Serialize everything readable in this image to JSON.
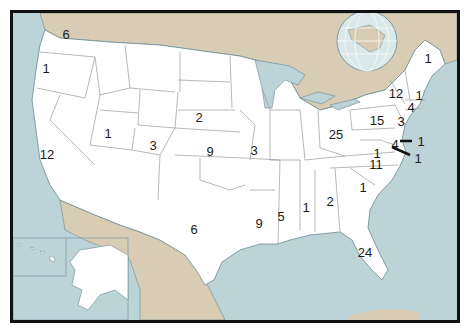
{
  "map": {
    "type": "US states choropleth-style count map",
    "colors": {
      "ocean": "#bcd3d8",
      "land_foreign": "#d9ccb4",
      "land_us": "#ffffff",
      "state_border": "#9a9a9a",
      "frame": "#111111",
      "label": "#1a1a1a"
    },
    "inset_globe": true,
    "inset_alaska_hawaii": true,
    "state_labels": [
      {
        "state": "Washington",
        "value": "6",
        "x": 66,
        "y": 34
      },
      {
        "state": "Oregon",
        "value": "1",
        "x": 46,
        "y": 68
      },
      {
        "state": "California",
        "value": "12",
        "x": 47,
        "y": 154
      },
      {
        "state": "Utah",
        "value": "1",
        "x": 108,
        "y": 133
      },
      {
        "state": "Colorado",
        "value": "3",
        "x": 153,
        "y": 145
      },
      {
        "state": "Nebraska",
        "value": "2",
        "x": 199,
        "y": 117
      },
      {
        "state": "Kansas",
        "value": "9",
        "x": 210,
        "y": 151
      },
      {
        "state": "Missouri",
        "value": "3",
        "x": 254,
        "y": 150
      },
      {
        "state": "Texas",
        "value": "6",
        "x": 194,
        "y": 229
      },
      {
        "state": "Louisiana",
        "value": "9",
        "x": 259,
        "y": 223
      },
      {
        "state": "Mississippi",
        "value": "5",
        "x": 281,
        "y": 216
      },
      {
        "state": "Alabama",
        "value": "1",
        "x": 306,
        "y": 207
      },
      {
        "state": "Georgia",
        "value": "2",
        "x": 330,
        "y": 201
      },
      {
        "state": "South Carolina",
        "value": "1",
        "x": 363,
        "y": 187
      },
      {
        "state": "North Carolina",
        "value": "11",
        "x": 376,
        "y": 164
      },
      {
        "state": "Florida",
        "value": "24",
        "x": 365,
        "y": 252
      },
      {
        "state": "Ohio",
        "value": "25",
        "x": 336,
        "y": 134
      },
      {
        "state": "Pennsylvania",
        "value": "15",
        "x": 377,
        "y": 120
      },
      {
        "state": "New York",
        "value": "12",
        "x": 396,
        "y": 93
      },
      {
        "state": "Maine",
        "value": "1",
        "x": 428,
        "y": 58
      },
      {
        "state": "Massachusetts",
        "value": "1",
        "x": 419,
        "y": 95
      },
      {
        "state": "Connecticut",
        "value": "4",
        "x": 411,
        "y": 107
      },
      {
        "state": "New Jersey",
        "value": "3",
        "x": 401,
        "y": 121
      },
      {
        "state": "Maryland",
        "value": "4",
        "x": 395,
        "y": 144
      },
      {
        "state": "Virginia",
        "value": "1",
        "x": 377,
        "y": 153
      },
      {
        "state": "Delaware",
        "value": "1",
        "x": 421,
        "y": 141
      },
      {
        "state": "District of Columbia",
        "value": "1",
        "x": 418,
        "y": 158
      }
    ]
  }
}
